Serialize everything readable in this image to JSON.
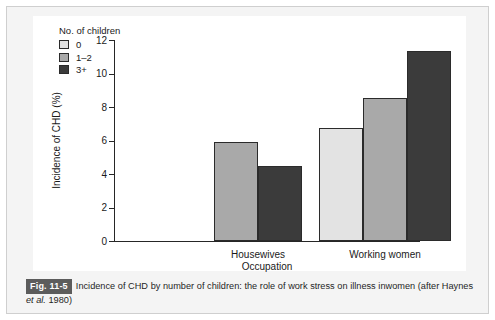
{
  "figure": {
    "caption_badge": "Fig. 11-5",
    "caption_line1": "Incidence of CHD by number of children: the role of work stress on illness in",
    "caption_line2_pre": "women (after Haynes ",
    "caption_line2_italic": "et al.",
    "caption_line2_post": " 1980)"
  },
  "colors": {
    "bar_0": "#e3e3e3",
    "bar_1_2": "#a9a9a9",
    "bar_3_plus": "#3b3b3b",
    "axis": "#262626",
    "badge_bg": "#5c5c5c",
    "page_bg": "#f4f4f4",
    "card_bg": "#ffffff"
  },
  "chart_data": {
    "type": "bar",
    "title": "",
    "xlabel": "Occupation",
    "ylabel": "Incidence of CHD (%)",
    "ylim": [
      0,
      12
    ],
    "yticks": [
      0,
      2,
      4,
      6,
      8,
      10,
      12
    ],
    "ytick_labels": [
      "0",
      "2",
      "4",
      "6",
      "8",
      "10",
      "12"
    ],
    "grid": false,
    "legend_title": "No. of children",
    "legend_position": "upper-left-inside",
    "categories": [
      "Housewives",
      "Working women"
    ],
    "series": [
      {
        "name": "0",
        "color": "#e3e3e3",
        "values": [
          null,
          6.75
        ]
      },
      {
        "name": "1–2",
        "color": "#a9a9a9",
        "values": [
          5.9,
          8.55
        ]
      },
      {
        "name": "3+",
        "color": "#3b3b3b",
        "values": [
          4.5,
          11.35
        ]
      }
    ]
  }
}
